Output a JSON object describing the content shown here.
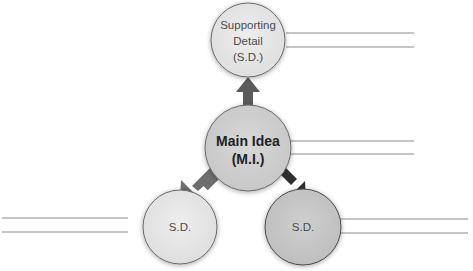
{
  "diagram": {
    "type": "main-idea-supporting-details",
    "colors": {
      "circle_fill_light": "#e6e6e6",
      "circle_fill_mid": "#d4d4d4",
      "circle_fill_main": "#cfcfcf",
      "circle_fill_dark": "#c4c4c4",
      "circle_stroke": "#6a6a6a",
      "arrow_up": "#5b5b5b",
      "arrow_left": "#6e6e6e",
      "arrow_right": "#2e2e2e",
      "line": "#8c8c8c"
    },
    "nodes": {
      "top": {
        "lines": [
          "Supporting",
          "Detail",
          "(S.D.)"
        ]
      },
      "main": {
        "lines": [
          "Main Idea",
          "(M.I.)"
        ]
      },
      "bottom_left": {
        "lines": [
          "S.D."
        ]
      },
      "bottom_right": {
        "lines": [
          "S.D."
        ]
      }
    },
    "writing_lines": {
      "top": 2,
      "main": 2,
      "bottom_left": 2,
      "bottom_right": 2
    }
  }
}
